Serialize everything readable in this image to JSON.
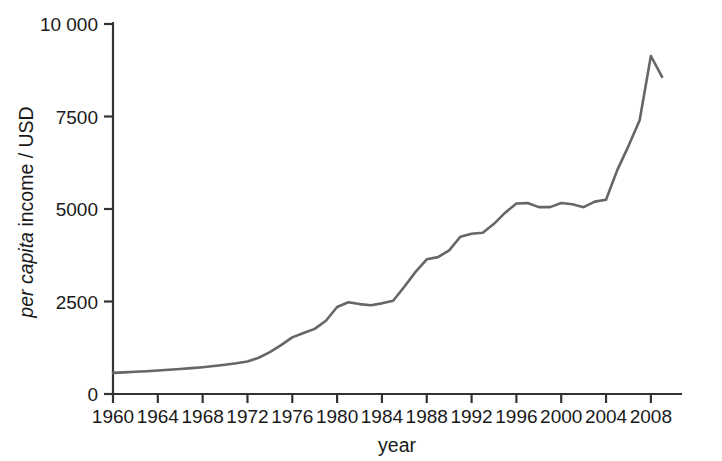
{
  "chart_data": {
    "type": "line",
    "title": "",
    "xlabel": "year",
    "ylabel": "per capita income / USD",
    "ylabel_italic_part": "per capita",
    "ylabel_roman_part": " income / USD",
    "xlim": [
      1960,
      2010
    ],
    "ylim": [
      0,
      10000
    ],
    "grid": false,
    "legend": null,
    "y_ticks": [
      0,
      2500,
      5000,
      7500,
      10000
    ],
    "y_tick_labels": [
      "0",
      "2500",
      "5000",
      "7500",
      "10 000"
    ],
    "x_ticks": [
      1960,
      1964,
      1968,
      1972,
      1976,
      1980,
      1984,
      1988,
      1992,
      1996,
      2000,
      2004,
      2008
    ],
    "x_tick_labels": [
      "1960",
      "1964",
      "1968",
      "1972",
      "1976",
      "1980",
      "1984",
      "1988",
      "1992",
      "1996",
      "2000",
      "2004",
      "2008"
    ],
    "line_color": "#666666",
    "axis_color": "#333333",
    "series": [
      {
        "name": "per capita income",
        "x": [
          1960,
          1961,
          1962,
          1963,
          1964,
          1965,
          1966,
          1967,
          1968,
          1969,
          1970,
          1971,
          1972,
          1973,
          1974,
          1975,
          1976,
          1977,
          1978,
          1979,
          1980,
          1981,
          1982,
          1983,
          1984,
          1985,
          1986,
          1987,
          1988,
          1989,
          1990,
          1991,
          1992,
          1993,
          1994,
          1995,
          1996,
          1997,
          1998,
          1999,
          2000,
          2001,
          2002,
          2003,
          2004,
          2005,
          2006,
          2007,
          2008,
          2009
        ],
        "values": [
          570,
          585,
          600,
          615,
          635,
          655,
          675,
          700,
          725,
          755,
          790,
          830,
          880,
          980,
          1130,
          1320,
          1530,
          1650,
          1760,
          1980,
          2350,
          2480,
          2430,
          2400,
          2450,
          2520,
          2900,
          3300,
          3640,
          3700,
          3880,
          4250,
          4330,
          4360,
          4600,
          4900,
          5150,
          5160,
          5050,
          5050,
          5160,
          5130,
          5050,
          5200,
          5250,
          6050,
          6700,
          7400,
          9135,
          8570
        ]
      }
    ]
  },
  "axis_geometry": {
    "plot_left": 113,
    "plot_right": 680,
    "plot_top": 24,
    "plot_bottom": 394,
    "x_min_year": 1960,
    "x_max_year": 2010.6,
    "y_min": 0,
    "y_max": 10000
  }
}
